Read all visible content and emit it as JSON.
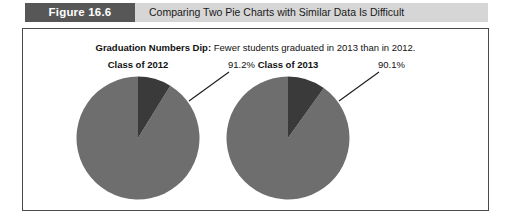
{
  "caption": {
    "figure_number": "Figure 16.6",
    "figure_title": "Comparing Two Pie Charts with Similar Data Is Difficult"
  },
  "figure": {
    "subtitle_lead": "Graduation Numbers Dip:",
    "subtitle_rest": " Fewer students graduated in 2013 than in 2012."
  },
  "colors": {
    "figure_number_bg": "#575757",
    "figure_title_bg": "#d6d6d6",
    "panel_border": "#4a4a4a",
    "slice_major": "#6e6e6e",
    "slice_minor": "#3a3a3a",
    "leader_line": "#1a1a1a"
  },
  "chart_data": [
    {
      "type": "pie",
      "title": "Class of 2012",
      "categories": [
        "Graduated",
        "Did not graduate"
      ],
      "values": [
        91.2,
        8.8
      ],
      "labels": [
        "91.2%",
        ""
      ],
      "annotation": "91.2%",
      "colors": [
        "#6e6e6e",
        "#3a3a3a"
      ],
      "legend": "none",
      "start_angle_deg": 0,
      "direction": "counterclockwise"
    },
    {
      "type": "pie",
      "title": "Class of 2013",
      "categories": [
        "Graduated",
        "Did not graduate"
      ],
      "values": [
        90.1,
        9.9
      ],
      "labels": [
        "90.1%",
        ""
      ],
      "annotation": "90.1%",
      "colors": [
        "#6e6e6e",
        "#3a3a3a"
      ],
      "legend": "none",
      "start_angle_deg": 0,
      "direction": "counterclockwise"
    }
  ]
}
